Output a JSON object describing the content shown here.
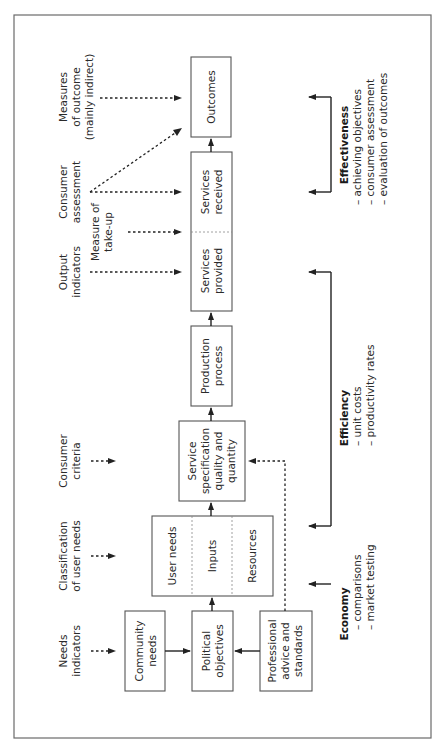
{
  "diagram": {
    "orientation": "rotated-90-ccw",
    "boxes": {
      "outcomes": "Outcomes",
      "services_received": [
        "Services",
        "received"
      ],
      "services_provided": [
        "Services",
        "provided"
      ],
      "production_process": [
        "Production",
        "process"
      ],
      "service_specification": [
        "Service",
        "specification",
        "quality and",
        "quantity"
      ],
      "user_needs": "User needs",
      "inputs": "Inputs",
      "resources": "Resources",
      "community_needs": [
        "Community",
        "needs"
      ],
      "political_objectives": [
        "Political",
        "objectives"
      ],
      "professional_advice": [
        "Professional",
        "advice and",
        "standards"
      ]
    },
    "indicators": {
      "measures_of_outcome": [
        "Measures",
        "of outcome",
        "(mainly indirect)"
      ],
      "consumer_assessment": [
        "Consumer",
        "assessment"
      ],
      "measure_of_take_up": [
        "Measure of",
        "take-up"
      ],
      "output_indicators": [
        "Output",
        "indicators"
      ],
      "consumer_criteria": [
        "Consumer",
        "criteria"
      ],
      "classification_of_user_needs": [
        "Classification",
        "of user needs"
      ],
      "needs_indicators": [
        "Needs",
        "indicators"
      ]
    },
    "criteria": {
      "effectiveness": {
        "title": "Effectiveness",
        "items": [
          "– achieving objectives",
          "– consumer assessment",
          "– evaluation of outcomes"
        ]
      },
      "efficiency": {
        "title": "Efficiency",
        "items": [
          "– unit costs",
          "– productivity rates"
        ]
      },
      "economy": {
        "title": "Economy",
        "items": [
          "– comparisons",
          "– market testing"
        ]
      }
    }
  }
}
